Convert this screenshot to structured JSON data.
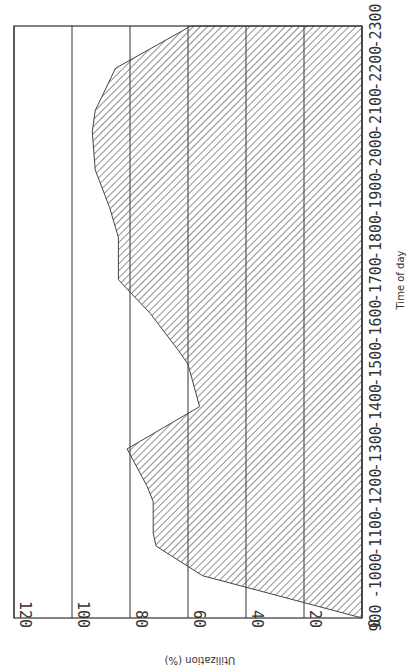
{
  "chart_data": {
    "type": "area",
    "orientation": "rotated 90deg clockwise (time axis runs vertically on right, value axis horizontal at bottom, reversed)",
    "title": "",
    "xlabel": "Time of day",
    "ylabel": "Utilization (%)",
    "x_ticks": [
      "900",
      "1000",
      "1100",
      "1200",
      "1300",
      "1400",
      "1500",
      "1600",
      "1700",
      "1800",
      "1900",
      "2000",
      "2100",
      "2200",
      "2300"
    ],
    "y_ticks": [
      "0",
      "20",
      "40",
      "60",
      "80",
      "100",
      "120"
    ],
    "xlim": [
      900,
      2300
    ],
    "ylim": [
      0,
      120
    ],
    "grid": "horizontal gridlines at each y tick",
    "fill": "diagonal hatch",
    "x": [
      900,
      1000,
      1070,
      1100,
      1175,
      1210,
      1300,
      1400,
      1500,
      1530,
      1620,
      1700,
      1800,
      1870,
      1960,
      2050,
      2100,
      2200,
      2300
    ],
    "values": [
      0,
      55,
      71,
      72,
      72,
      74,
      81,
      56,
      60,
      63,
      73,
      84,
      84,
      87,
      92,
      93,
      92,
      85,
      59
    ]
  },
  "labels": {
    "x_title": "Time of day",
    "y_title": "Utilization (%)"
  }
}
